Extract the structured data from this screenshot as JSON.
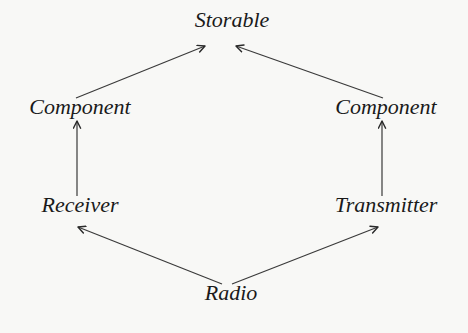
{
  "diagram": {
    "type": "inheritance-graph",
    "nodes": [
      {
        "id": "storable",
        "label": "Storable",
        "x": 232,
        "y": 27
      },
      {
        "id": "component_left",
        "label": "Component",
        "x": 80,
        "y": 114
      },
      {
        "id": "component_right",
        "label": "Component",
        "x": 386,
        "y": 114
      },
      {
        "id": "receiver",
        "label": "Receiver",
        "x": 80,
        "y": 212
      },
      {
        "id": "transmitter",
        "label": "Transmitter",
        "x": 386,
        "y": 212
      },
      {
        "id": "radio",
        "label": "Radio",
        "x": 231,
        "y": 300
      }
    ],
    "edges": [
      {
        "from": "component_left",
        "to": "storable"
      },
      {
        "from": "component_right",
        "to": "storable"
      },
      {
        "from": "receiver",
        "to": "component_left"
      },
      {
        "from": "transmitter",
        "to": "component_right"
      },
      {
        "from": "radio",
        "to": "receiver"
      },
      {
        "from": "radio",
        "to": "transmitter"
      }
    ],
    "colors": {
      "text": "#1a1a1a",
      "edge": "#3a3a3a",
      "background": "#f8f8f6"
    }
  }
}
